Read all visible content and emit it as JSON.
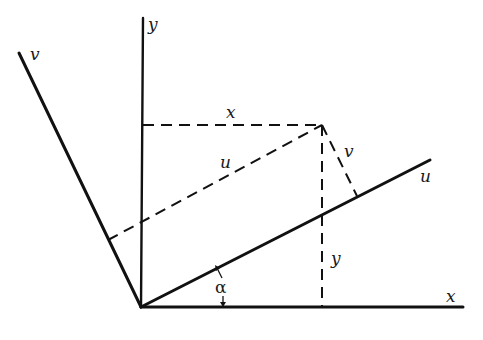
{
  "diagram": {
    "colors": {
      "line": "#111111",
      "background": "#ffffff"
    },
    "origin": [
      141,
      307
    ],
    "point_P": [
      322,
      125
    ],
    "axes": {
      "x": {
        "label": "x",
        "from": [
          141,
          307
        ],
        "to": [
          463,
          307
        ]
      },
      "y": {
        "label": "y",
        "from": [
          141,
          307
        ],
        "to": [
          143,
          18
        ]
      },
      "u": {
        "label": "u",
        "from": [
          141,
          307
        ],
        "to": [
          430,
          160
        ]
      },
      "v": {
        "label": "v",
        "from": [
          141,
          307
        ],
        "to": [
          19,
          53
        ]
      }
    },
    "projections": {
      "x_dashed": {
        "label": "x",
        "from": [
          143,
          125
        ],
        "to": [
          322,
          125
        ]
      },
      "y_dashed": {
        "label": "y",
        "from": [
          322,
          125
        ],
        "to": [
          322,
          307
        ]
      },
      "u_dashed": {
        "label": "u",
        "from": [
          108,
          240
        ],
        "to": [
          322,
          125
        ]
      },
      "v_dashed": {
        "label": "v",
        "from": [
          322,
          125
        ],
        "to": [
          357,
          196
        ]
      }
    },
    "angle": {
      "label": "α"
    },
    "labels": {
      "y_axis": "y",
      "v_axis": "v",
      "x_proj": "x",
      "u_proj": "u",
      "v_proj": "v",
      "u_axis": "u",
      "y_proj": "y",
      "alpha": "α",
      "x_axis": "x"
    }
  }
}
